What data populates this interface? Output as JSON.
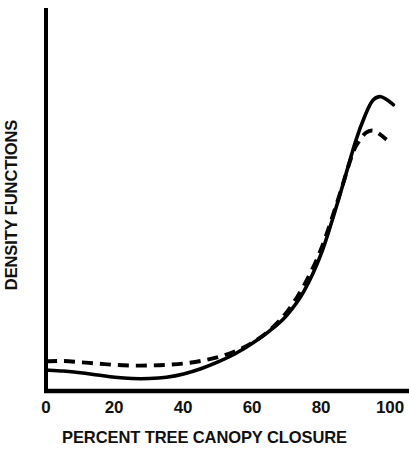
{
  "chart_data": {
    "type": "line",
    "title": "",
    "xlabel": "PERCENT TREE CANOPY CLOSURE",
    "ylabel": "DENSITY FUNCTIONS",
    "xlim": [
      0,
      105
    ],
    "ylim": [
      0,
      1
    ],
    "grid": false,
    "legend": "none",
    "xticks": [
      "0",
      "20",
      "40",
      "60",
      "80",
      "100"
    ],
    "xtick_values": [
      0,
      20,
      40,
      60,
      80,
      100
    ],
    "yticks": [],
    "axis_color": "#000000",
    "series": [
      {
        "name": "density-function-solid",
        "style": "solid",
        "color": "#000000",
        "x": [
          0,
          5,
          10,
          15,
          20,
          25,
          30,
          35,
          40,
          45,
          50,
          55,
          60,
          65,
          70,
          75,
          80,
          85,
          90,
          93,
          95,
          97,
          99,
          101
        ],
        "values": [
          0.058,
          0.055,
          0.05,
          0.043,
          0.036,
          0.032,
          0.032,
          0.036,
          0.046,
          0.062,
          0.083,
          0.108,
          0.14,
          0.178,
          0.226,
          0.3,
          0.415,
          0.58,
          0.76,
          0.845,
          0.885,
          0.897,
          0.888,
          0.872
        ]
      },
      {
        "name": "density-function-dashed",
        "style": "dashed",
        "color": "#000000",
        "dash_pattern": "11 7",
        "x": [
          0,
          5,
          10,
          15,
          20,
          25,
          30,
          35,
          40,
          45,
          50,
          55,
          60,
          65,
          70,
          75,
          80,
          85,
          89,
          91,
          93,
          95,
          97,
          99
        ],
        "values": [
          0.085,
          0.086,
          0.082,
          0.078,
          0.074,
          0.072,
          0.072,
          0.074,
          0.078,
          0.086,
          0.098,
          0.116,
          0.142,
          0.18,
          0.236,
          0.318,
          0.43,
          0.585,
          0.718,
          0.76,
          0.786,
          0.793,
          0.782,
          0.765
        ]
      }
    ]
  },
  "axes": {
    "x_title": "PERCENT TREE CANOPY CLOSURE",
    "y_title": "DENSITY FUNCTIONS",
    "tick_labels": [
      "0",
      "20",
      "40",
      "60",
      "80",
      "100"
    ]
  }
}
